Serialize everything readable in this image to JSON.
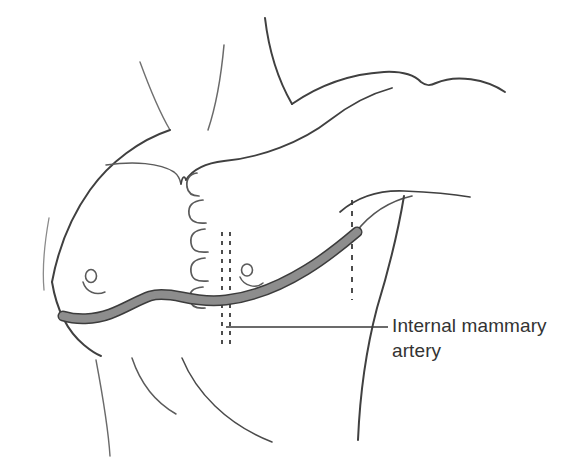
{
  "figure": {
    "kind": "anatomical-line-drawing",
    "view": "anterior-oblique",
    "background_color": "#ffffff",
    "width": 587,
    "height": 470
  },
  "annotation": {
    "label_line_1": "Internal mammary",
    "label_line_2": "artery",
    "full_label": "Internal mammary artery",
    "text_color": "#333333",
    "leader_line_color": "#3a3a3a"
  },
  "highlighted_structure": {
    "name": "internal mammary artery",
    "fill_color": "#8d8d8d",
    "stroke_color": "#3c3c3c",
    "description": "thick shaded band running along the inframammary fold and curving superolaterally toward the axilla"
  },
  "line_art": {
    "body_outline_color": "#404040",
    "soft_contour_color": "#6f6f6f",
    "rib_marking_color": "#5a5a5a",
    "dashed_line_color": "#3a3a3a"
  },
  "landmarks": {
    "rib_markings_count": 5,
    "nipple_count": 2,
    "sternal_midline_dashed_lines": 2,
    "axillary_dashed_lines": 1
  }
}
